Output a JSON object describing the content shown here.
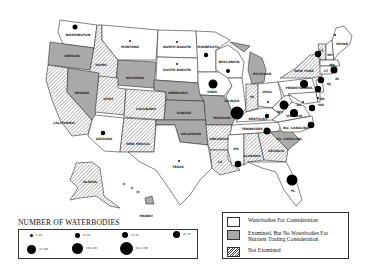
{
  "map": {
    "states": [
      {
        "id": "WA",
        "label": "WASHINGTON",
        "category": "waterbodies",
        "dot": 3
      },
      {
        "id": "OR",
        "label": "OREGON",
        "category": "examined_none",
        "dot": 0
      },
      {
        "id": "CA",
        "label": "CALIFORNIA",
        "category": "not_examined",
        "dot": 0
      },
      {
        "id": "NV",
        "label": "NEVADA",
        "category": "examined_none",
        "dot": 0
      },
      {
        "id": "ID",
        "label": "IDAHO",
        "category": "not_examined",
        "dot": 0
      },
      {
        "id": "MT",
        "label": "MONTANA",
        "category": "waterbodies",
        "dot": 1
      },
      {
        "id": "WY",
        "label": "WYOMING",
        "category": "examined_none",
        "dot": 0
      },
      {
        "id": "UT",
        "label": "UTAH",
        "category": "not_examined",
        "dot": 0
      },
      {
        "id": "CO",
        "label": "COLORADO",
        "category": "not_examined",
        "dot": 0
      },
      {
        "id": "AZ",
        "label": "ARIZONA",
        "category": "waterbodies",
        "dot": 3
      },
      {
        "id": "NM",
        "label": "NEW MEXICO",
        "category": "not_examined",
        "dot": 0
      },
      {
        "id": "ND",
        "label": "NORTH DAKOTA",
        "category": "waterbodies",
        "dot": 1
      },
      {
        "id": "SD",
        "label": "SOUTH DAKOTA",
        "category": "waterbodies",
        "dot": 1
      },
      {
        "id": "NE",
        "label": "NEBRASKA",
        "category": "examined_none",
        "dot": 0
      },
      {
        "id": "KS",
        "label": "KANSAS",
        "category": "examined_none",
        "dot": 0
      },
      {
        "id": "OK",
        "label": "OKLAHOMA",
        "category": "examined_none",
        "dot": 0
      },
      {
        "id": "TX",
        "label": "TEXAS",
        "category": "waterbodies",
        "dot": 1
      },
      {
        "id": "MN",
        "label": "MINNESOTA",
        "category": "waterbodies",
        "dot": 3
      },
      {
        "id": "IA",
        "label": "IOWA",
        "category": "waterbodies",
        "dot": 5
      },
      {
        "id": "MO",
        "label": "MISSOURI",
        "category": "examined_none",
        "dot": 0
      },
      {
        "id": "AR",
        "label": "ARKANSAS",
        "category": "not_examined",
        "dot": 0
      },
      {
        "id": "LA",
        "label": "LA",
        "category": "not_examined",
        "dot": 0
      },
      {
        "id": "WI",
        "label": "WISCONSIN",
        "category": "waterbodies",
        "dot": 3
      },
      {
        "id": "IL",
        "label": "ILLINOIS",
        "category": "waterbodies",
        "dot": 7
      },
      {
        "id": "MI",
        "label": "MICHIGAN",
        "category": "examined_none",
        "dot": 0
      },
      {
        "id": "IN",
        "label": "IN",
        "category": "not_examined",
        "dot": 0
      },
      {
        "id": "OH",
        "label": "OHIO",
        "category": "waterbodies",
        "dot": 1
      },
      {
        "id": "KY",
        "label": "KENTUCKY",
        "category": "waterbodies",
        "dot": 3
      },
      {
        "id": "TN",
        "label": "TENNESSEE",
        "category": "waterbodies",
        "dot": 4
      },
      {
        "id": "MS",
        "label": "MS",
        "category": "waterbodies",
        "dot": 4
      },
      {
        "id": "AL",
        "label": "ALABAMA",
        "category": "not_examined",
        "dot": 0
      },
      {
        "id": "GA",
        "label": "GEORGIA",
        "category": "not_examined",
        "dot": 0
      },
      {
        "id": "FL",
        "label": "FL",
        "category": "waterbodies",
        "dot": 6
      },
      {
        "id": "SC",
        "label": "SO. CAROLINA",
        "category": "examined_none",
        "dot": 0
      },
      {
        "id": "NC",
        "label": "NO. CAROLINA",
        "category": "waterbodies",
        "dot": 4
      },
      {
        "id": "VA",
        "label": "VIRGINIA",
        "category": "waterbodies",
        "dot": 5
      },
      {
        "id": "WV",
        "label": "WV",
        "category": "waterbodies",
        "dot": 6
      },
      {
        "id": "PA",
        "label": "PENNSYLVANIA",
        "category": "waterbodies",
        "dot": 5
      },
      {
        "id": "NY",
        "label": "NEW YORK",
        "category": "not_examined",
        "dot": 4
      },
      {
        "id": "MD",
        "label": "MD",
        "category": "waterbodies",
        "dot": 4
      },
      {
        "id": "DE",
        "label": "DE",
        "category": "waterbodies",
        "dot": 1
      },
      {
        "id": "DC",
        "label": "DC",
        "category": "waterbodies",
        "dot": 1
      },
      {
        "id": "NJ",
        "label": "NJ",
        "category": "waterbodies",
        "dot": 4
      },
      {
        "id": "CT",
        "label": "CT",
        "category": "waterbodies",
        "dot": 4
      },
      {
        "id": "RI",
        "label": "RI",
        "category": "waterbodies",
        "dot": 0
      },
      {
        "id": "MA",
        "label": "MA",
        "category": "waterbodies",
        "dot": 4
      },
      {
        "id": "VT",
        "label": "VT",
        "category": "not_examined",
        "dot": 0
      },
      {
        "id": "NH",
        "label": "NH",
        "category": "waterbodies",
        "dot": 0
      },
      {
        "id": "ME",
        "label": "MAINE",
        "category": "waterbodies",
        "dot": 1
      },
      {
        "id": "AK",
        "label": "ALASKA",
        "category": "not_examined",
        "dot": 0
      },
      {
        "id": "HI",
        "label": "HAWAII",
        "category": "examined_none",
        "dot": 0
      }
    ]
  },
  "size_legend": {
    "title": "NUMBER OF WATERBODIES",
    "items": [
      {
        "label": "1-10",
        "size": 1
      },
      {
        "label": "11-20",
        "size": 2
      },
      {
        "label": "21-40",
        "size": 3
      },
      {
        "label": "41-70",
        "size": 4
      },
      {
        "label": "71-100",
        "size": 5
      },
      {
        "label": "101-200",
        "size": 6
      },
      {
        "label": "Over 200",
        "size": 7
      }
    ]
  },
  "category_legend": {
    "items": [
      {
        "key": "waterbodies",
        "label": "Waterbodies For Consideration",
        "color": "#ffffff"
      },
      {
        "key": "examined_none",
        "label": "Examined, But No Waterbodies For Nutrient Trading Consideration",
        "color": "#a9a9a9"
      },
      {
        "key": "not_examined",
        "label": "Not Examined",
        "color": "hatched"
      }
    ],
    "labels": {
      "waterbodies": "Waterbodies For Consideration",
      "examined_none_1": "Examined, But No Waterbodies For",
      "examined_none_2": "Nutrient Trading Consideration",
      "not_examined": "Not Examined"
    }
  }
}
